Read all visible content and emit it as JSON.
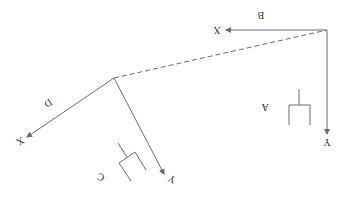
{
  "diagram": {
    "orientation": "rotated-180",
    "colors": {
      "line": "#6b6b6b",
      "text": "#333333",
      "background": "#ffffff"
    },
    "frames": [
      {
        "id": "B",
        "label": "B",
        "x_axis_label": "X",
        "y_axis_label": "Y"
      },
      {
        "id": "D",
        "label": "D",
        "x_axis_label": "X",
        "y_axis_label": "Y"
      }
    ],
    "objects": [
      {
        "id": "A",
        "label": "A",
        "shape": "gripper-fork"
      },
      {
        "id": "C",
        "label": "C",
        "shape": "gripper-fork"
      }
    ],
    "connection": {
      "from": "D",
      "to": "B",
      "style": "dashed"
    }
  }
}
